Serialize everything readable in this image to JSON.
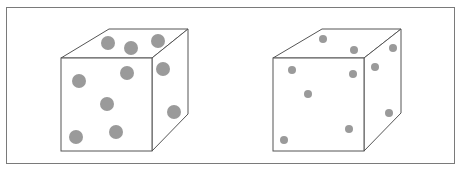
{
  "figure": {
    "frame": {
      "x": 6,
      "y": 7,
      "w": 449,
      "h": 157
    },
    "line_color": "#555555",
    "dot_color": "#9a9a9a",
    "cubes": [
      {
        "name": "cube-large-dots",
        "dot_radius": 7,
        "front": {
          "x1": 61,
          "y1": 58,
          "x2": 152,
          "y2": 151
        },
        "back": {
          "x1": 109,
          "y1": 29,
          "x2": 188,
          "y2": 114
        },
        "dots": [
          [
            108,
            43
          ],
          [
            131,
            48
          ],
          [
            158,
            41
          ],
          [
            79,
            81
          ],
          [
            127,
            73
          ],
          [
            163,
            69
          ],
          [
            107,
            104
          ],
          [
            174,
            112
          ],
          [
            76,
            137
          ],
          [
            116,
            132
          ]
        ]
      },
      {
        "name": "cube-small-dots",
        "dot_radius": 4,
        "front": {
          "x1": 273,
          "y1": 58,
          "x2": 364,
          "y2": 151
        },
        "back": {
          "x1": 322,
          "y1": 29,
          "x2": 401,
          "y2": 113
        },
        "dots": [
          [
            323,
            39
          ],
          [
            354,
            50
          ],
          [
            393,
            48
          ],
          [
            292,
            70
          ],
          [
            353,
            74
          ],
          [
            375,
            67
          ],
          [
            308,
            94
          ],
          [
            389,
            113
          ],
          [
            284,
            140
          ],
          [
            349,
            129
          ]
        ]
      }
    ]
  }
}
